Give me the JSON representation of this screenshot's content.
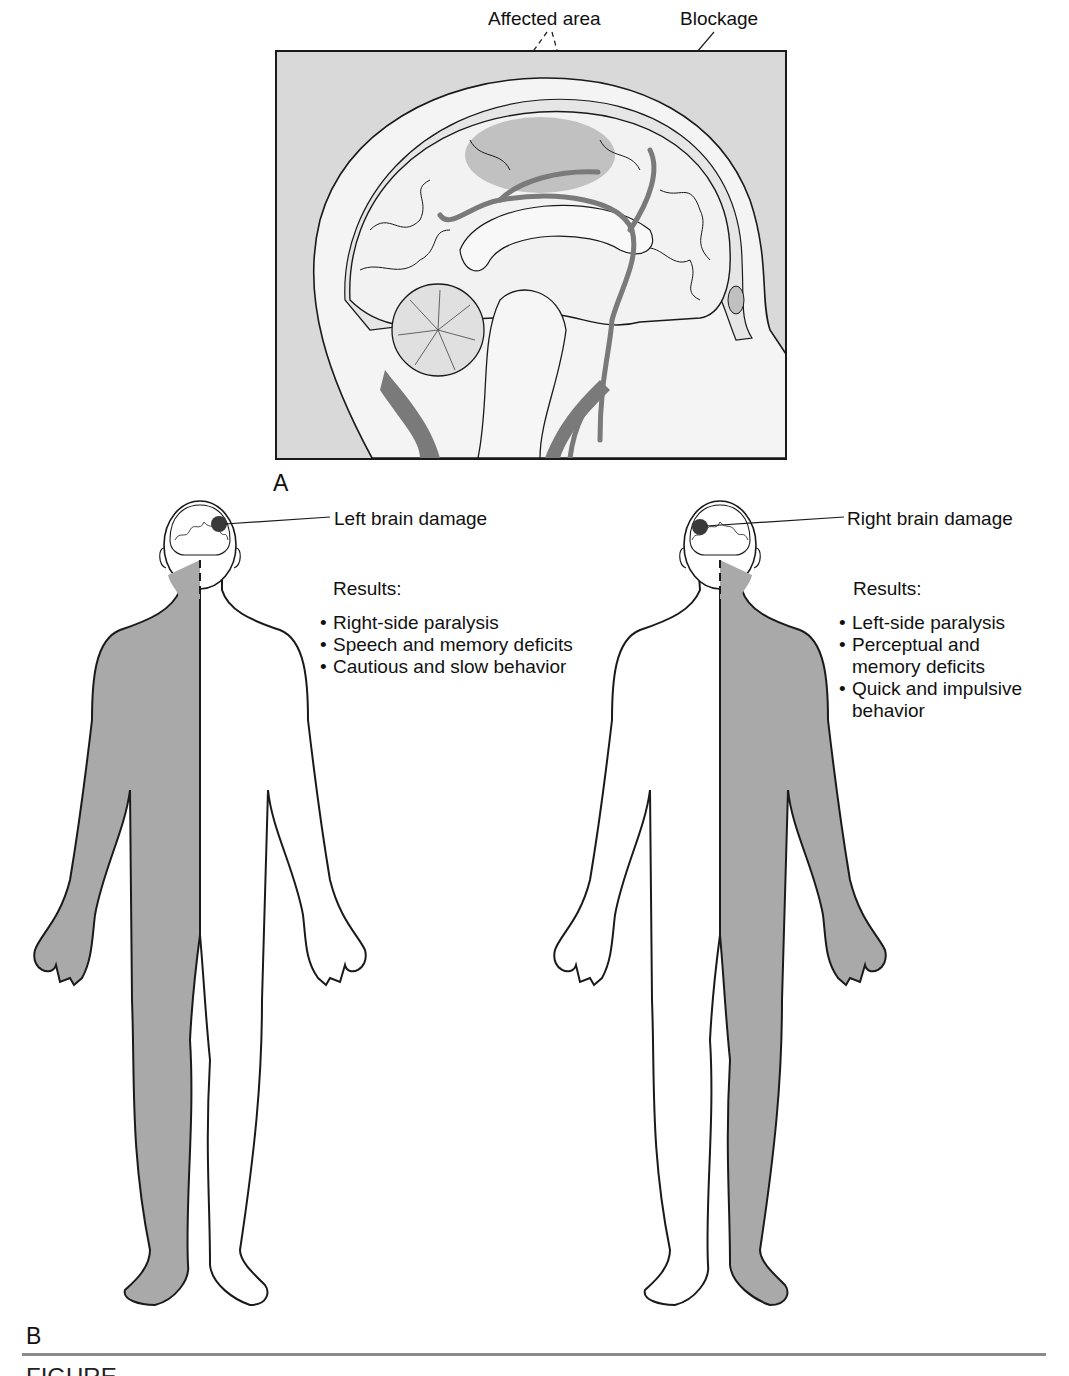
{
  "panel_a": {
    "letter": "A",
    "labels": {
      "affected_area": "Affected area",
      "blockage": "Blockage"
    },
    "colors": {
      "background": "#d9d9d9",
      "brain": "#f2f2f2",
      "vessels": "#7a7a7a",
      "affected": "#b0b0b0",
      "outline": "#1a1a1a"
    }
  },
  "panel_b": {
    "letter": "B",
    "left_figure": {
      "callout": "Left brain damage",
      "results_title": "Results:",
      "results": [
        "Right-side paralysis",
        "Speech and memory deficits",
        "Cautious and slow behavior"
      ],
      "affected_side": "right"
    },
    "right_figure": {
      "callout": "Right brain damage",
      "results_title": "Results:",
      "results": [
        "Left-side paralysis",
        "Perceptual and memory deficits",
        "Quick and impulsive behavior"
      ],
      "affected_side": "left"
    },
    "colors": {
      "paralyzed_fill": "#a9a9a9",
      "body_fill": "#ffffff",
      "lesion": "#3a3a3a"
    }
  },
  "caption": {
    "fragment": "FIGURE"
  }
}
